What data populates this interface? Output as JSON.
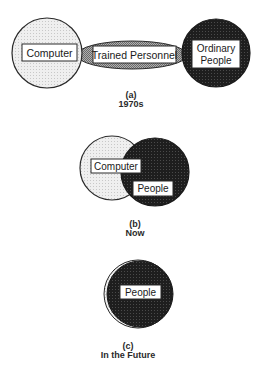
{
  "diagram": {
    "colors": {
      "light_circle": "#ececec",
      "dark_circle": "#262626",
      "bridge": "#9a9a9a",
      "stroke": "#2a2a2a",
      "label_box": "#ffffff"
    },
    "panel_a": {
      "letter": "(a)",
      "caption": "1970s",
      "computer_label": "Computer",
      "bridge_label": "Trained Personnel",
      "people_label_line1": "Ordinary",
      "people_label_line2": "People"
    },
    "panel_b": {
      "letter": "(b)",
      "caption": "Now",
      "computer_label": "Computer",
      "people_label": "People"
    },
    "panel_c": {
      "letter": "(c)",
      "caption": "In the Future",
      "people_label": "People"
    }
  }
}
